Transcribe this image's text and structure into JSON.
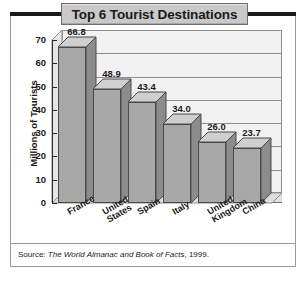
{
  "figure": {
    "title": "Top 6 Tourist Destinations",
    "source_prefix": "Source:",
    "source_italic": "The World Almanac and Book of Facts",
    "source_suffix": ", 1999."
  },
  "chart_data": {
    "type": "bar",
    "title": "Top 6 Tourist Destinations",
    "xlabel": "",
    "ylabel": "Millions of Tourists",
    "categories": [
      "France",
      "United States",
      "Spain",
      "Italy",
      "United Kingdom",
      "China"
    ],
    "category_lines": [
      [
        "France"
      ],
      [
        "United",
        "States"
      ],
      [
        "Spain"
      ],
      [
        "Italy"
      ],
      [
        "United",
        "Kingdom"
      ],
      [
        "China"
      ]
    ],
    "values": [
      66.8,
      48.9,
      43.4,
      34.0,
      26.0,
      23.7
    ],
    "value_labels": [
      "66.8",
      "48.9",
      "43.4",
      "34.0",
      "26.0",
      "23.7"
    ],
    "ylim": [
      0,
      70
    ],
    "yticks": [
      70,
      60,
      50,
      40,
      30,
      20,
      10,
      0
    ],
    "ytick_labels": [
      "70",
      "60",
      "50",
      "40",
      "30",
      "20",
      "10",
      "0"
    ],
    "grid": true,
    "legend": "none",
    "style": "3d-column",
    "colors": {
      "bar_front": "#a8a8a8",
      "bar_top": "#cfcfcf",
      "bar_side": "#8c8c8c",
      "bar_outline": "#4a4a4a",
      "plot_background": "#f2f2f2",
      "gridline": "#8e8e8e",
      "title_plaque": "#c9c9c9",
      "frame": "#9a9a9a",
      "text": "#1a1a1a"
    }
  }
}
